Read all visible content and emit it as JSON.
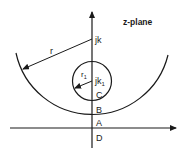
{
  "diagram": {
    "title": "z-plane",
    "points": {
      "center_large": "jk",
      "center_small_main": "jk",
      "center_small_sub": "1"
    },
    "radii": {
      "large": "r",
      "small_main": "r",
      "small_sub": "1"
    },
    "axis_points": [
      "C",
      "B",
      "A",
      "D"
    ],
    "colors": {
      "stroke": "#1a1a1a",
      "background": "#ffffff"
    }
  }
}
